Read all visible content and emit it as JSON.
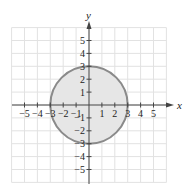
{
  "chart_data": {
    "type": "region",
    "title": "",
    "xlabel": "x",
    "ylabel": "y",
    "xlim": [
      -6,
      6
    ],
    "ylim": [
      -6,
      6
    ],
    "grid": true,
    "x_ticks": [
      -5,
      -4,
      -3,
      -2,
      -1,
      1,
      2,
      3,
      4,
      5
    ],
    "y_ticks": [
      -5,
      -4,
      -3,
      -2,
      -1,
      1,
      2,
      3,
      4,
      5
    ],
    "x_tick_labels": [
      "−5",
      "−4",
      "−3",
      "−2",
      "−1",
      "1",
      "2",
      "3",
      "4",
      "5"
    ],
    "y_tick_labels": [
      "−5",
      "−4",
      "−3",
      "−2",
      "−1",
      "1",
      "2",
      "3",
      "4",
      "5"
    ],
    "shapes": [
      {
        "kind": "circle",
        "center": [
          0,
          0
        ],
        "radius": 3,
        "filled": true,
        "fill_color": "#e6e6e6",
        "stroke_color": "#8a8a8a",
        "boundary": "solid"
      }
    ]
  },
  "colors": {
    "grid": "#e2e2e2",
    "axis": "#444444",
    "fill": "#e6e6e6",
    "stroke": "#8a8a8a"
  }
}
